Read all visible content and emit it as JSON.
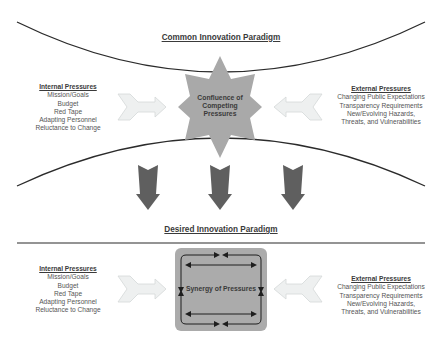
{
  "top_section": {
    "title": "Common Innovation Paradigm",
    "center_label": [
      "Confluence of",
      "Competing",
      "Pressures"
    ],
    "center_shape": "eight-point-star",
    "internal": {
      "heading": "Internal Pressures",
      "items": [
        "Mission/Goals",
        "Budget",
        "Red Tape",
        "Adapting Personnel",
        "Reluctance to Change"
      ]
    },
    "external": {
      "heading": "External Pressures",
      "items": [
        "Changing Public Expectations",
        "Transparency Requirements",
        "New/Evolving Hazards,",
        "Threats, and Vulnerabilities"
      ]
    }
  },
  "transition": {
    "arrow_count": 3,
    "arrow_direction": "down"
  },
  "bottom_section": {
    "title": "Desired Innovation Paradigm",
    "center_label": "Synergy of Pressures",
    "center_shape": "rounded-square-with-cyclic-arrows",
    "internal": {
      "heading": "Internal Pressures",
      "items": [
        "Mission/Goals",
        "Budget",
        "Red Tape",
        "Adapting Personnel",
        "Reluctance to Change"
      ]
    },
    "external": {
      "heading": "External Pressures",
      "items": [
        "Changing Public Expectations",
        "Transparency Requirements",
        "New/Evolving Hazards,",
        "Threats, and Vulnerabilities"
      ]
    }
  },
  "colors": {
    "curve": "#2b2b2b",
    "star_fill": "#a9a9a9",
    "down_arrow_fill": "#5f5f5f",
    "light_arrow_fill": "#eef0f0",
    "light_arrow_stroke": "#d4d8d8",
    "square_fill": "#ababab",
    "text": "#4a4a4a"
  }
}
